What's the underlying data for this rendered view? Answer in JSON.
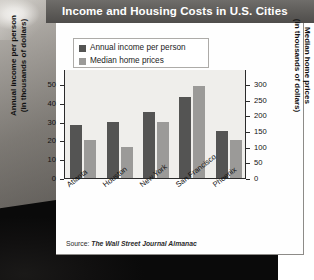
{
  "header": {
    "title": "Income and Housing Costs in U.S. Cities"
  },
  "legend": {
    "items": [
      {
        "label": "Annual income per person",
        "color": "#545453"
      },
      {
        "label": "Median home prices",
        "color": "#9b9a98"
      }
    ]
  },
  "axes": {
    "left_title": "Annual income per person\n(in thousands of dollars)",
    "right_title": "Median home prices\n(in thousands of dollars)",
    "left_ticks": [
      "0",
      "10",
      "20",
      "30",
      "40",
      "50"
    ],
    "right_ticks": [
      "0",
      "50",
      "100",
      "150",
      "200",
      "250",
      "300"
    ]
  },
  "footer": {
    "source_prefix": "Source: ",
    "source_name": "The Wall Street Journal Almanac"
  },
  "chart_data": {
    "type": "bar",
    "title": "Income and Housing Costs in U.S. Cities",
    "categories": [
      "Atlanta",
      "Houston",
      "New York",
      "San Francisco",
      "Phoenix"
    ],
    "series": [
      {
        "name": "Annual income per person",
        "axis": "left",
        "unit": "thousands of dollars",
        "color": "#545453",
        "values": [
          28,
          30,
          35,
          43,
          25
        ]
      },
      {
        "name": "Median home prices",
        "axis": "right",
        "unit": "thousands of dollars",
        "color": "#9b9a98",
        "values": [
          120,
          100,
          180,
          295,
          120
        ]
      }
    ],
    "xlabel": "",
    "ylabel": "Annual income per person (in thousands of dollars)",
    "y2label": "Median home prices (in thousands of dollars)",
    "ylim": [
      0,
      58
    ],
    "y2lim": [
      0,
      348
    ],
    "yticks": [
      0,
      10,
      20,
      30,
      40,
      50
    ],
    "y2ticks": [
      0,
      50,
      100,
      150,
      200,
      250,
      300
    ],
    "grid": false,
    "legend_position": "top-left"
  }
}
